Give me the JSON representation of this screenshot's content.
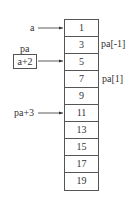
{
  "diagram": {
    "array_values": [
      "1",
      "3",
      "5",
      "7",
      "9",
      "11",
      "13",
      "15",
      "17",
      "19"
    ],
    "labels": {
      "a": "a",
      "pa_name": "pa",
      "pa_value": "a+2",
      "pa_plus_3": "pa+3",
      "pa_minus_1": "pa[-1]",
      "pa_1": "pa[1]"
    }
  }
}
